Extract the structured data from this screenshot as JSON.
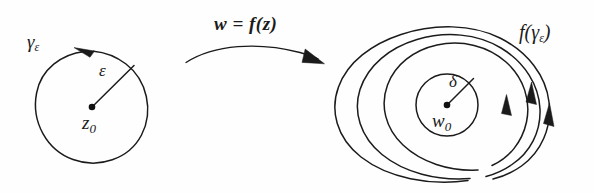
{
  "figure": {
    "domain": "complex-analysis-diagram",
    "background_color": "#fefefe",
    "ink_color": "#1b1b1b",
    "width": 594,
    "height": 193
  },
  "left_panel": {
    "name": "source-plane-circle",
    "contour_label": "γ",
    "contour_label_subscript": "ε",
    "radius_label": "ε",
    "center_label": "z",
    "center_label_subscript": "0",
    "orientation": "counterclockwise",
    "circle": {
      "cx": 92,
      "cy": 107,
      "r": 56
    },
    "center_dot": {
      "cx": 92,
      "cy": 107,
      "r": 3.2
    },
    "radius_line": {
      "x1": 92,
      "y1": 107,
      "x2": 133,
      "y2": 66
    }
  },
  "transform_arrow": {
    "name": "mapping-arrow",
    "label_w": "w",
    "label_equals": "=",
    "label_f": "f",
    "label_open": "(",
    "label_z": "z",
    "label_close": ")",
    "full_label": "w = f(z)",
    "direction": "left-to-right"
  },
  "right_panel": {
    "name": "image-plane-loops",
    "image_label_f": "f",
    "image_label_open": "(",
    "image_label_gamma": "γ",
    "image_label_subscript": "ε",
    "image_label_close": ")",
    "full_image_label": "f(γε)",
    "radius_label": "δ",
    "center_label": "w",
    "center_label_subscript": "0",
    "loop_count": 3,
    "orientation": "counterclockwise",
    "delta_circle": {
      "cx": 447,
      "cy": 105,
      "r": 31
    },
    "center_dot": {
      "cx": 447,
      "cy": 105,
      "r": 3.2
    },
    "radius_line": {
      "x1": 447,
      "y1": 105,
      "x2": 473,
      "y2": 79
    },
    "arrowheads": 3
  }
}
